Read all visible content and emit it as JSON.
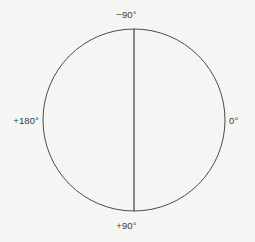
{
  "figure": {
    "kind": "position-angle-circle",
    "background_color": "#f5f5f3",
    "stroke_color": "#4a4a4a",
    "label_color": "#3c3c3c"
  },
  "labels": {
    "top": "−90°",
    "bottom": "+90°",
    "left": "+180°",
    "right": "0°"
  },
  "chart_data": {
    "type": "scatter",
    "title": "",
    "subtitle": "",
    "xlabel": "",
    "ylabel": "",
    "grid": false,
    "legend": null,
    "axis_convention": "angle measured around circle; 0 degrees at right, +90 at bottom, +180 at left, -90 at top",
    "circle": {
      "center_x": 134,
      "center_y": 120,
      "radius": 91,
      "stroke": "#4a4a4a",
      "stroke_width": 1,
      "fill": "none"
    },
    "lines": [
      {
        "name": "vertical-diameter",
        "x1": 134,
        "y1": 29,
        "x2": 134,
        "y2": 211,
        "stroke": "#555555",
        "stroke_width": 1.4
      }
    ],
    "annotations": [
      {
        "text": "−90°",
        "angle_deg": -90,
        "position": "top",
        "x": 134,
        "y": 15
      },
      {
        "text": "0°",
        "angle_deg": 0,
        "position": "right",
        "x": 236,
        "y": 120
      },
      {
        "text": "+90°",
        "angle_deg": 90,
        "position": "bottom",
        "x": 134,
        "y": 226
      },
      {
        "text": "+180°",
        "angle_deg": 180,
        "position": "left",
        "x": 22,
        "y": 120
      }
    ],
    "categories": [
      "−90°",
      "0°",
      "+90°",
      "+180°"
    ],
    "values": [
      -90,
      0,
      90,
      180
    ]
  }
}
